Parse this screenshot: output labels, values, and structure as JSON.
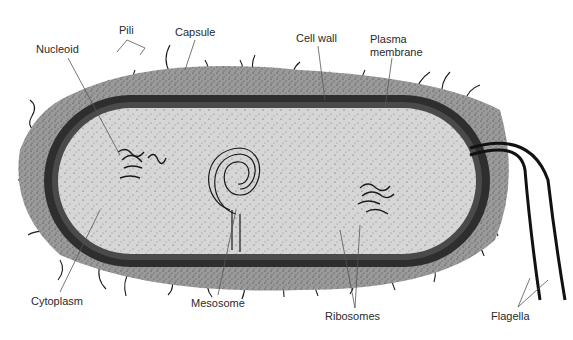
{
  "diagram": {
    "labels": {
      "pili": "Pili",
      "capsule": "Capsule",
      "nucleoid": "Nucleoid",
      "cell_wall": "Cell wall",
      "plasma_membrane_line1": "Plasma",
      "plasma_membrane_line2": "membrane",
      "cytoplasm": "Cytoplasm",
      "mesosome": "Mesosome",
      "ribosomes": "Ribosomes",
      "flagella": "Flagella"
    },
    "colors": {
      "capsule": "#9a9a9a",
      "cell_wall": "#333333",
      "cytoplasm": "#d6d6d6",
      "stroke": "#1a1a1a",
      "leader_line": "#555555",
      "text": "#2a2a2a"
    }
  }
}
